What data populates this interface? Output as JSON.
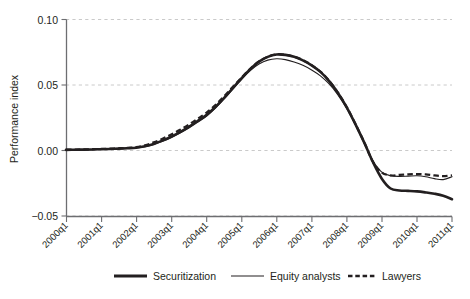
{
  "chart_data": {
    "type": "line",
    "title": "",
    "xlabel": "",
    "ylabel": "Performance index",
    "ylim": [
      -0.05,
      0.1
    ],
    "yticks": [
      -0.05,
      0.0,
      0.05,
      0.1
    ],
    "ytick_labels": [
      "−0.05",
      "0.00",
      "0.05",
      "0.10"
    ],
    "grid": true,
    "grid_axis": "y",
    "grid_style": "dashed",
    "legend_position": "bottom",
    "x": [
      "2000q1",
      "2000q2",
      "2000q3",
      "2000q4",
      "2001q1",
      "2001q2",
      "2001q3",
      "2001q4",
      "2002q1",
      "2002q2",
      "2002q3",
      "2002q4",
      "2003q1",
      "2003q2",
      "2003q3",
      "2003q4",
      "2004q1",
      "2004q2",
      "2004q3",
      "2004q4",
      "2005q1",
      "2005q2",
      "2005q3",
      "2005q4",
      "2006q1",
      "2006q2",
      "2006q3",
      "2006q4",
      "2007q1",
      "2007q2",
      "2007q3",
      "2007q4",
      "2008q1",
      "2008q2",
      "2008q3",
      "2008q4",
      "2009q1",
      "2009q2",
      "2009q3",
      "2009q4",
      "2010q1",
      "2010q2",
      "2010q3",
      "2010q4",
      "2011q1"
    ],
    "xtick_labels": [
      "2000q1",
      "2001q1",
      "2002q1",
      "2003q1",
      "2004q1",
      "2005q1",
      "2006q1",
      "2007q1",
      "2008q1",
      "2009q1",
      "2010q1",
      "2011q1"
    ],
    "series": [
      {
        "name": "Securitization",
        "style": "thick-solid",
        "color": "#231f20",
        "values": [
          0.0005,
          0.0006,
          0.0007,
          0.0008,
          0.001,
          0.0012,
          0.0014,
          0.0017,
          0.0021,
          0.0032,
          0.005,
          0.0075,
          0.0105,
          0.014,
          0.018,
          0.0225,
          0.027,
          0.033,
          0.04,
          0.0475,
          0.055,
          0.062,
          0.0678,
          0.0715,
          0.0733,
          0.073,
          0.0715,
          0.0688,
          0.065,
          0.06,
          0.053,
          0.044,
          0.033,
          0.02,
          0.006,
          -0.009,
          -0.0215,
          -0.029,
          -0.0305,
          -0.0308,
          -0.0312,
          -0.032,
          -0.033,
          -0.0345,
          -0.0372
        ]
      },
      {
        "name": "Equity analysts",
        "style": "thin-solid",
        "color": "#231f20",
        "values": [
          0.0004,
          0.0005,
          0.0006,
          0.0007,
          0.0009,
          0.0011,
          0.0013,
          0.0016,
          0.002,
          0.003,
          0.0047,
          0.0071,
          0.01,
          0.0134,
          0.0172,
          0.0216,
          0.0262,
          0.0322,
          0.0392,
          0.0468,
          0.0542,
          0.061,
          0.066,
          0.069,
          0.07,
          0.0694,
          0.0676,
          0.065,
          0.0615,
          0.057,
          0.0508,
          0.0425,
          0.032,
          0.0195,
          0.0055,
          -0.008,
          -0.0165,
          -0.0192,
          -0.0198,
          -0.0196,
          -0.0193,
          -0.02,
          -0.0215,
          -0.0222,
          -0.02
        ]
      },
      {
        "name": "Lawyers",
        "style": "dashed",
        "color": "#231f20",
        "values": [
          0.0006,
          0.0007,
          0.0008,
          0.001,
          0.0012,
          0.0014,
          0.0017,
          0.002,
          0.0026,
          0.004,
          0.0062,
          0.009,
          0.0122,
          0.0158,
          0.0198,
          0.0242,
          0.0288,
          0.0345,
          0.0412,
          0.0485,
          0.0556,
          0.0624,
          0.068,
          0.0716,
          0.0734,
          0.0731,
          0.0716,
          0.069,
          0.0652,
          0.0602,
          0.0532,
          0.0442,
          0.0332,
          0.0202,
          0.0062,
          -0.0088,
          -0.0168,
          -0.019,
          -0.0186,
          -0.0182,
          -0.018,
          -0.0183,
          -0.019,
          -0.0196,
          -0.019
        ]
      }
    ],
    "annotations": []
  },
  "axes": {
    "y_axis_title": "Performance index",
    "y_tick_labels": [
      "0.10",
      "0.05",
      "0.00",
      "−0.05"
    ],
    "x_tick_labels": [
      "2000q1",
      "2001q1",
      "2002q1",
      "2003q1",
      "2004q1",
      "2005q1",
      "2006q1",
      "2007q1",
      "2008q1",
      "2009q1",
      "2010q1",
      "2011q1"
    ]
  },
  "legend": {
    "items": [
      {
        "label": "Securitization",
        "style": "thick-solid"
      },
      {
        "label": "Equity analysts",
        "style": "thin-solid"
      },
      {
        "label": "Lawyers",
        "style": "dashed"
      }
    ]
  },
  "colors": {
    "ink": "#231f20",
    "grid": "#bdbdbd",
    "axis": "#6d6e71",
    "background": "#ffffff"
  }
}
